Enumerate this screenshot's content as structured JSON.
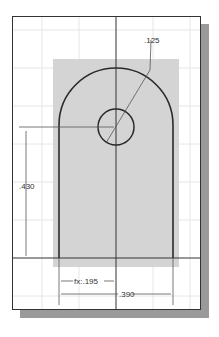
{
  "drawing": {
    "type": "cad-sketch",
    "dimensions": {
      "hole_diameter": ".125",
      "height": ".430",
      "half_width": "fx:.195",
      "width": ".390"
    },
    "colors": {
      "sheet": "#ffffff",
      "grid": "#e6e6e6",
      "shaded_region": "#d4d4d4",
      "profile": "#2a2a2a",
      "dimension": "#555555",
      "shadow": "#9a9a9a"
    }
  }
}
